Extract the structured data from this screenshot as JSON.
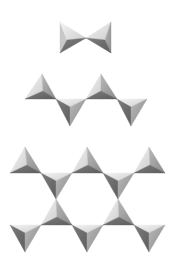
{
  "diagram": {
    "background": "#ffffff",
    "shading": {
      "light": "#ececec",
      "light2": "#d6d6d6",
      "mid": "#a2a2a2",
      "dark": "#6e6e6e"
    },
    "groups": [
      {
        "name": "dimer",
        "tetrahedra": [
          {
            "orient": "right",
            "cx": 67,
            "cy": 40,
            "apex": [
              86,
              38
            ],
            "base": [
              [
                60,
                22
              ],
              [
                60,
                53
              ]
            ]
          },
          {
            "orient": "left",
            "cx": 105,
            "cy": 40,
            "apex": [
              86,
              38
            ],
            "base": [
              [
                111,
                22
              ],
              [
                111,
                53
              ]
            ]
          }
        ]
      },
      {
        "name": "single-chain",
        "tetrahedra": [
          {
            "orient": "up",
            "cx": 43,
            "cy": 91,
            "apex": [
              42,
              74
            ],
            "base": [
              [
                25,
                99
              ],
              [
                56,
                99
              ]
            ]
          },
          {
            "orient": "down",
            "cx": 70,
            "cy": 107,
            "apex": [
              70,
              126
            ],
            "base": [
              [
                56,
                99
              ],
              [
                86,
                99
              ]
            ]
          },
          {
            "orient": "up",
            "cx": 101,
            "cy": 91,
            "apex": [
              101,
              74
            ],
            "base": [
              [
                86,
                99
              ],
              [
                117,
                99
              ]
            ]
          },
          {
            "orient": "down",
            "cx": 131,
            "cy": 107,
            "apex": [
              131,
              126
            ],
            "base": [
              [
                117,
                99
              ],
              [
                147,
                99
              ]
            ]
          }
        ]
      },
      {
        "name": "double-chain",
        "tetrahedra": [
          {
            "orient": "up",
            "cx": 27,
            "cy": 165,
            "apex": [
              25,
              147
            ],
            "base": [
              [
                10,
                173
              ],
              [
                41,
                173
              ]
            ]
          },
          {
            "orient": "down",
            "cx": 56,
            "cy": 181,
            "apex": [
              56,
              199
            ],
            "base": [
              [
                41,
                173
              ],
              [
                72,
                173
              ]
            ]
          },
          {
            "orient": "up",
            "cx": 88,
            "cy": 165,
            "apex": [
              87,
              147
            ],
            "base": [
              [
                72,
                173
              ],
              [
                103,
                173
              ]
            ]
          },
          {
            "orient": "down",
            "cx": 118,
            "cy": 181,
            "apex": [
              118,
              199
            ],
            "base": [
              [
                103,
                173
              ],
              [
                134,
                173
              ]
            ]
          },
          {
            "orient": "up",
            "cx": 150,
            "cy": 165,
            "apex": [
              149,
              147
            ],
            "base": [
              [
                134,
                173
              ],
              [
                165,
                173
              ]
            ]
          },
          {
            "orient": "up",
            "cx": 57,
            "cy": 217,
            "apex": [
              56,
              199
            ],
            "base": [
              [
                41,
                225
              ],
              [
                72,
                225
              ]
            ]
          },
          {
            "orient": "up",
            "cx": 119,
            "cy": 217,
            "apex": [
              118,
              199
            ],
            "base": [
              [
                103,
                225
              ],
              [
                134,
                225
              ]
            ]
          },
          {
            "orient": "down",
            "cx": 25,
            "cy": 233,
            "apex": [
              25,
              252
            ],
            "base": [
              [
                10,
                225
              ],
              [
                41,
                225
              ]
            ]
          },
          {
            "orient": "down",
            "cx": 87,
            "cy": 233,
            "apex": [
              87,
              252
            ],
            "base": [
              [
                72,
                225
              ],
              [
                103,
                225
              ]
            ]
          },
          {
            "orient": "down",
            "cx": 149,
            "cy": 233,
            "apex": [
              149,
              252
            ],
            "base": [
              [
                134,
                225
              ],
              [
                165,
                225
              ]
            ]
          }
        ]
      }
    ]
  }
}
